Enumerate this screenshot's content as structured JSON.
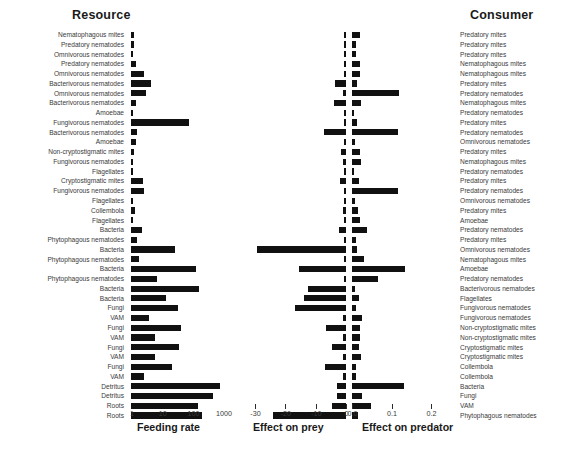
{
  "headings": {
    "resource": "Resource",
    "consumer": "Consumer"
  },
  "axes": {
    "feeding": {
      "title": "Feeding rate",
      "scale": "log10",
      "ticks": [
        "1",
        "10",
        "100",
        "1000"
      ],
      "tick_values": [
        1,
        10,
        100,
        1000
      ]
    },
    "prey": {
      "title": "Effect on prey",
      "scale": "linear",
      "ticks": [
        "-30",
        "-20",
        "-10",
        "0"
      ],
      "tick_values": [
        -30,
        -20,
        -10,
        0
      ]
    },
    "predator": {
      "title": "Effect on predator",
      "scale": "linear",
      "ticks": [
        "0.0",
        "0.1",
        "0.2"
      ],
      "tick_values": [
        0.0,
        0.1,
        0.2
      ]
    }
  },
  "chart_data": {
    "type": "bar",
    "orientation": "horizontal",
    "title": "",
    "panels": [
      {
        "name": "feeding_rate",
        "xlabel": "Feeding rate",
        "scale": "log10",
        "xlim": [
          1,
          3000
        ],
        "grid": false
      },
      {
        "name": "effect_on_prey",
        "xlabel": "Effect on prey",
        "scale": "linear",
        "xlim": [
          -34,
          0
        ],
        "grid": false
      },
      {
        "name": "effect_on_predator",
        "xlabel": "Effect on predator",
        "scale": "linear",
        "xlim": [
          0,
          0.23
        ],
        "grid": false
      }
    ],
    "legend": "none",
    "rows": [
      {
        "resource": "Nematophagous mites",
        "consumer": "Predatory mites",
        "feeding_rate": 1.3,
        "effect_on_prey": -0.6,
        "effect_on_predator": 0.021
      },
      {
        "resource": "Predatory nematodes",
        "consumer": "Predatory mites",
        "feeding_rate": 1.3,
        "effect_on_prey": -0.6,
        "effect_on_predator": 0.011
      },
      {
        "resource": "Omnivorous nematodes",
        "consumer": "Predatory mites",
        "feeding_rate": 1.2,
        "effect_on_prey": -0.6,
        "effect_on_predator": 0.011
      },
      {
        "resource": "Predatory nematodes",
        "consumer": "Nematophagous mites",
        "feeding_rate": 1.5,
        "effect_on_prey": -0.7,
        "effect_on_predator": 0.019
      },
      {
        "resource": "Omnivorous nematodes",
        "consumer": "Nematophagous mites",
        "feeding_rate": 2.6,
        "effect_on_prey": -0.7,
        "effect_on_predator": 0.019
      },
      {
        "resource": "Bacterivorous nematodes",
        "consumer": "Predatory mites",
        "feeding_rate": 4.4,
        "effect_on_prey": -3.6,
        "effect_on_predator": 0.012
      },
      {
        "resource": "Omnivorous nematodes",
        "consumer": "Predatory nematodes",
        "feeding_rate": 3.1,
        "effect_on_prey": -0.9,
        "effect_on_predator": 0.118
      },
      {
        "resource": "Bacterivorous nematodes",
        "consumer": "Nematophagous mites",
        "feeding_rate": 1.5,
        "effect_on_prey": -3.9,
        "effect_on_predator": 0.022
      },
      {
        "resource": "Amoebae",
        "consumer": "Predatory nematodes",
        "feeding_rate": 0,
        "effect_on_prey": -0.3,
        "effect_on_predator": 0.005
      },
      {
        "resource": "Fungivorous nematodes",
        "consumer": "Predatory mites",
        "feeding_rate": 78,
        "effect_on_prey": -0.6,
        "effect_on_predator": 0.012
      },
      {
        "resource": "Bacterivorous nematodes",
        "consumer": "Predatory nematodes",
        "feeding_rate": 1.6,
        "effect_on_prey": -7.4,
        "effect_on_predator": 0.117
      },
      {
        "resource": "Amoebae",
        "consumer": "Omnivorous nematodes",
        "feeding_rate": 1.5,
        "effect_on_prey": -0.6,
        "effect_on_predator": 0.007
      },
      {
        "resource": "Non-cryptostigmatic mites",
        "consumer": "Predatory mites",
        "feeding_rate": 1.3,
        "effect_on_prey": -1.8,
        "effect_on_predator": 0.021
      },
      {
        "resource": "Fungivorous nematodes",
        "consumer": "Nematophagous mites",
        "feeding_rate": 0,
        "effect_on_prey": -0.9,
        "effect_on_predator": 0.022
      },
      {
        "resource": "Flagellates",
        "consumer": "Predatory nematodes",
        "feeding_rate": 0,
        "effect_on_prey": -0.3,
        "effect_on_predator": 0.005
      },
      {
        "resource": "Cryptostigmatic mites",
        "consumer": "Predatory mites",
        "feeding_rate": 2.4,
        "effect_on_prey": -2.1,
        "effect_on_predator": 0.018
      },
      {
        "resource": "Fungivorous nematodes",
        "consumer": "Predatory nematodes",
        "feeding_rate": 2.6,
        "effect_on_prey": -0.6,
        "effect_on_predator": 0.116
      },
      {
        "resource": "Flagellates",
        "consumer": "Omnivorous nematodes",
        "feeding_rate": 0,
        "effect_on_prey": -0.3,
        "effect_on_predator": 0.007
      },
      {
        "resource": "Collembola",
        "consumer": "Predatory mites",
        "feeding_rate": 1.4,
        "effect_on_prey": -0.9,
        "effect_on_predator": 0.014
      },
      {
        "resource": "Flagellates",
        "consumer": "Amoebae",
        "feeding_rate": 0,
        "effect_on_prey": -0.3,
        "effect_on_predator": 0.019
      },
      {
        "resource": "Bacteria",
        "consumer": "Predatory nematodes",
        "feeding_rate": 2.3,
        "effect_on_prey": -2.4,
        "effect_on_predator": 0.038
      },
      {
        "resource": "Phytophagous nematodes",
        "consumer": "Predatory mites",
        "feeding_rate": 1.6,
        "effect_on_prey": -0.5,
        "effect_on_predator": 0.009
      },
      {
        "resource": "Bacteria",
        "consumer": "Omnivorous nematodes",
        "feeding_rate": 28,
        "effect_on_prey": -29.5,
        "effect_on_predator": 0.012
      },
      {
        "resource": "Phytophagous nematodes",
        "consumer": "Nematophagous mites",
        "feeding_rate": 1.8,
        "effect_on_prey": -0.5,
        "effect_on_predator": 0.03
      },
      {
        "resource": "Bacteria",
        "consumer": "Amoebae",
        "feeding_rate": 130,
        "effect_on_prey": -15.4,
        "effect_on_predator": 0.135
      },
      {
        "resource": "Phytophagous nematodes",
        "consumer": "Predatory nematodes",
        "feeding_rate": 7,
        "effect_on_prey": -0.8,
        "effect_on_predator": 0.065
      },
      {
        "resource": "Bacteria",
        "consumer": "Bacterivorous nematodes",
        "feeding_rate": 165,
        "effect_on_prey": -12.6,
        "effect_on_predator": 0.007
      },
      {
        "resource": "Bacteria",
        "consumer": "Flagellates",
        "feeding_rate": 14,
        "effect_on_prey": -13.8,
        "effect_on_predator": 0.018
      },
      {
        "resource": "Fungi",
        "consumer": "Fungivorous nematodes",
        "feeding_rate": 34,
        "effect_on_prey": -16.8,
        "effect_on_predator": 0.011
      },
      {
        "resource": "VAM",
        "consumer": "Fungivorous nematodes",
        "feeding_rate": 4,
        "effect_on_prey": -0.9,
        "effect_on_predator": 0.026
      },
      {
        "resource": "Fungi",
        "consumer": "Non-cryptostigmatic mites",
        "feeding_rate": 42,
        "effect_on_prey": -6.6,
        "effect_on_predator": 0.021
      },
      {
        "resource": "VAM",
        "consumer": "Non-cryptostigmatic mites",
        "feeding_rate": 6,
        "effect_on_prey": -1.0,
        "effect_on_predator": 0.02
      },
      {
        "resource": "Fungi",
        "consumer": "Cryptostigmatic mites",
        "feeding_rate": 38,
        "effect_on_prey": -4.6,
        "effect_on_predator": 0.018
      },
      {
        "resource": "VAM",
        "consumer": "Cryptostigmatic mites",
        "feeding_rate": 6,
        "effect_on_prey": -1.0,
        "effect_on_predator": 0.022
      },
      {
        "resource": "Fungi",
        "consumer": "Collembola",
        "feeding_rate": 21,
        "effect_on_prey": -6.9,
        "effect_on_predator": 0.01
      },
      {
        "resource": "VAM",
        "consumer": "Collembola",
        "feeding_rate": 2.6,
        "effect_on_prey": -0.9,
        "effect_on_predator": 0.011
      },
      {
        "resource": "Detritus",
        "consumer": "Bacteria",
        "feeding_rate": 790,
        "effect_on_prey": -2.9,
        "effect_on_predator": 0.131
      },
      {
        "resource": "Detritus",
        "consumer": "Fungi",
        "feeding_rate": 460,
        "effect_on_prey": -3.0,
        "effect_on_predator": 0.026
      },
      {
        "resource": "Roots",
        "consumer": "VAM",
        "feeding_rate": 155,
        "effect_on_prey": -4.6,
        "effect_on_predator": 0.049
      },
      {
        "resource": "Roots",
        "consumer": "Phytophagous nematodes",
        "feeding_rate": 210,
        "effect_on_prey": -24.0,
        "effect_on_predator": 0.016
      }
    ]
  }
}
